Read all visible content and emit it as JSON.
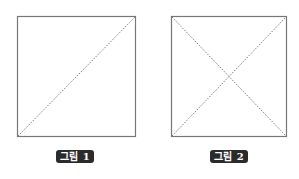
{
  "figures": [
    {
      "label": "그림 1",
      "diagonals": [
        "bottom-left-to-top-right"
      ]
    },
    {
      "label": "그림 2",
      "diagonals": [
        "bottom-left-to-top-right",
        "top-left-to-bottom-right"
      ]
    }
  ],
  "colors": {
    "border": "#777777",
    "diagonal": "#555555",
    "label_bg": "#2b2b2b",
    "label_text": "#ffffff"
  }
}
